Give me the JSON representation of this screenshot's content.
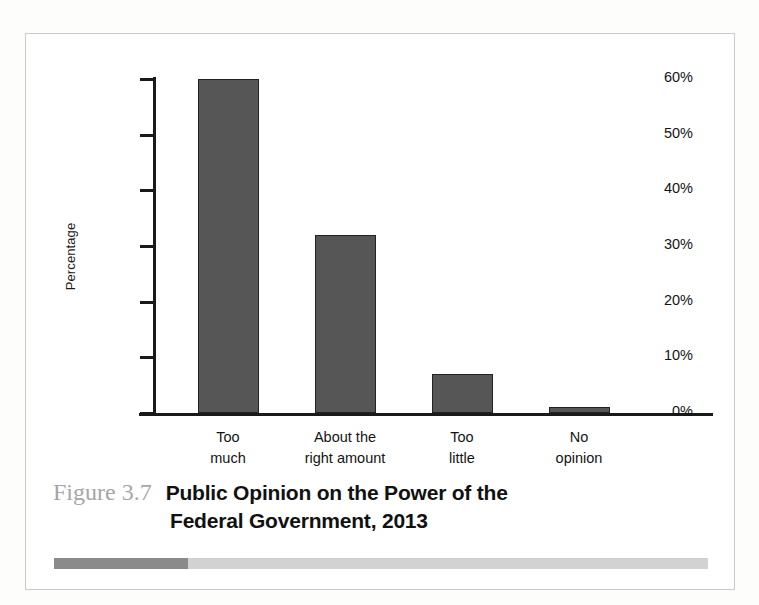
{
  "figure": {
    "number_label": "Figure 3.7",
    "title_line1": "Public Opinion on the Power of the",
    "title_line2": "Federal Government, 2013",
    "number_color": "#a6a6a6",
    "title_color": "#111111",
    "frame_color": "#c9c9c9",
    "rule_dark_color": "#8a8a8a",
    "rule_light_color": "#d2d2d2"
  },
  "chart_data": {
    "type": "bar",
    "title": "Public Opinion on the Power of the Federal Government, 2013",
    "categories": [
      "Too much",
      "About the right amount",
      "Too little",
      "No opinion"
    ],
    "category_lines": [
      [
        "Too",
        "much"
      ],
      [
        "About the",
        "right amount"
      ],
      [
        "Too",
        "little"
      ],
      [
        "No",
        "opinion"
      ]
    ],
    "values": [
      60,
      32,
      7,
      1
    ],
    "xlabel": "",
    "ylabel": "Percentage",
    "ylim": [
      0,
      60
    ],
    "ytick_values": [
      0,
      10,
      20,
      30,
      40,
      50,
      60
    ],
    "ytick_labels": [
      "0%",
      "10%",
      "20%",
      "30%",
      "40%",
      "50%",
      "60%"
    ],
    "grid": false,
    "legend": false,
    "bar_color": "#565656",
    "bar_edge_color": "#232323",
    "axis_color": "#1a1a1a"
  }
}
